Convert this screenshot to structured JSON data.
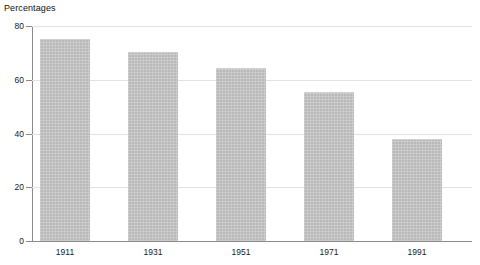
{
  "chart_data": {
    "type": "bar",
    "title": "Percentages",
    "xlabel": "",
    "ylabel": "",
    "categories": [
      "1911",
      "1931",
      "1951",
      "1971",
      "1991"
    ],
    "values": [
      75,
      70.5,
      64.5,
      55.5,
      38
    ],
    "ylim": [
      0,
      80
    ],
    "yticks": [
      0,
      20,
      40,
      60,
      80
    ],
    "ytick_labels": [
      "0",
      "20",
      "40",
      "60",
      "80"
    ],
    "grid": "horizontal",
    "legend": "none",
    "bar_color": "#b9b9b9",
    "grid_color": "#e2e2e2",
    "axis_color": "#8a8a8a",
    "background": "#ffffff"
  }
}
